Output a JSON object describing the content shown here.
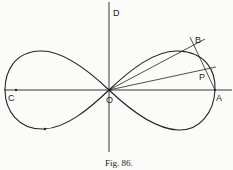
{
  "figure": {
    "caption": "Fig. 86.",
    "curve": "lemniscate",
    "ink_color": "#222222",
    "background": "#fbfbf9"
  },
  "labels": {
    "D": "D",
    "B": "B",
    "P": "P",
    "A": "A",
    "C": "C",
    "O": "O"
  }
}
